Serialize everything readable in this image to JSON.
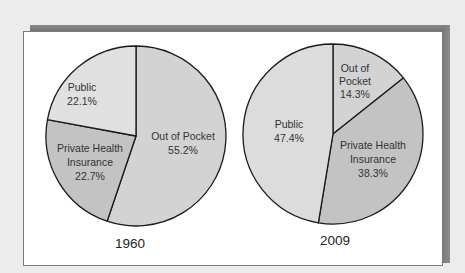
{
  "chart_data": [
    {
      "type": "pie",
      "title": "1960",
      "categories": [
        "Out of Pocket",
        "Private Health Insurance",
        "Public"
      ],
      "values": [
        55.2,
        22.7,
        22.1
      ],
      "unit": "%",
      "labels": [
        {
          "line1": "Out of Pocket",
          "line2": "55.2%"
        },
        {
          "line1": "Private Health",
          "line2": "Insurance",
          "line3": "22.7%"
        },
        {
          "line1": "Public",
          "line2": "22.1%"
        }
      ],
      "colors": [
        "#d3d3d3",
        "#c3c3c3",
        "#e0e0e0"
      ]
    },
    {
      "type": "pie",
      "title": "2009",
      "categories": [
        "Out of Pocket",
        "Private Health Insurance",
        "Public"
      ],
      "values": [
        14.3,
        38.3,
        47.4
      ],
      "unit": "%",
      "labels": [
        {
          "line1": "Out of",
          "line2": "Pocket",
          "line3": "14.3%"
        },
        {
          "line1": "Private Health",
          "line2": "Insurance",
          "line3": "38.3%"
        },
        {
          "line1": "Public",
          "line2": "47.4%"
        }
      ],
      "colors": [
        "#d3d3d3",
        "#c3c3c3",
        "#dcdcdc"
      ]
    }
  ],
  "pies": {
    "p1960": {
      "year": "1960",
      "oop_l1": "Out of Pocket",
      "oop_l2": "55.2%",
      "phi_l1": "Private Health",
      "phi_l2": "Insurance",
      "phi_l3": "22.7%",
      "pub_l1": "Public",
      "pub_l2": "22.1%"
    },
    "p2009": {
      "year": "2009",
      "oop_l1": "Out of",
      "oop_l2": "Pocket",
      "oop_l3": "14.3%",
      "phi_l1": "Private Health",
      "phi_l2": "Insurance",
      "phi_l3": "38.3%",
      "pub_l1": "Public",
      "pub_l2": "47.4%"
    }
  }
}
